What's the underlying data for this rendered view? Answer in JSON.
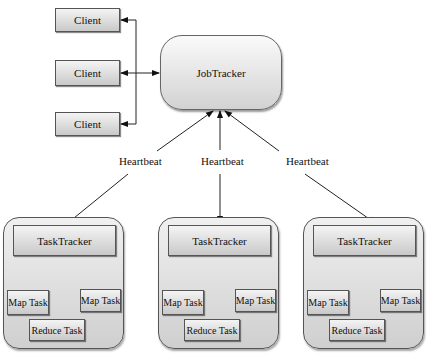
{
  "diagram": {
    "title": "",
    "clients": [
      {
        "label": "Client"
      },
      {
        "label": "Client"
      },
      {
        "label": "Client"
      }
    ],
    "jobtracker": {
      "label": "JobTracker"
    },
    "heartbeats": [
      {
        "label": "Heartbeat"
      },
      {
        "label": "Heartbeat"
      },
      {
        "label": "Heartbeat"
      }
    ],
    "tasktrackers": [
      {
        "label": "TaskTracker",
        "tasks": {
          "map_left": "Map Task",
          "map_right": "Map Task",
          "reduce": "Reduce Task"
        }
      },
      {
        "label": "TaskTracker",
        "tasks": {
          "map_left": "Map Task",
          "map_right": "Map Task",
          "reduce": "Reduce Task"
        }
      },
      {
        "label": "TaskTracker",
        "tasks": {
          "map_left": "Map Task",
          "map_right": "Map Task",
          "reduce": "Reduce Task"
        }
      }
    ],
    "colors": {
      "stroke": "#333333",
      "fill_top": "#f4f4f4",
      "fill_bottom": "#c9c9c9"
    }
  }
}
